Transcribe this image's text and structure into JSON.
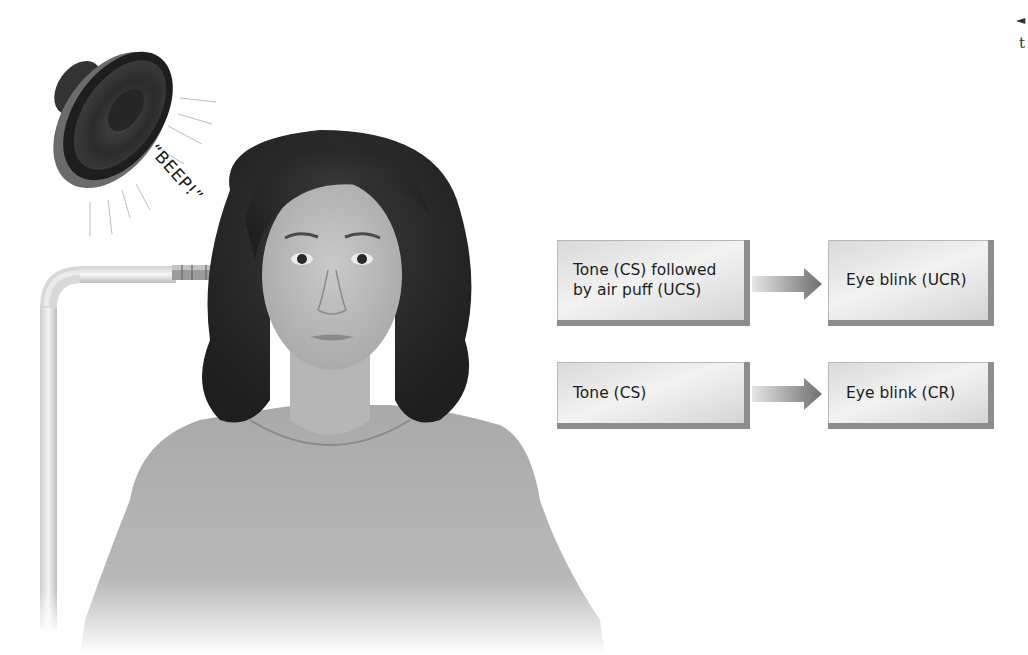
{
  "figure": {
    "sound_effect_label": "“BEEP!”",
    "stimulus_source": "speaker",
    "apparatus": "air-puff tube"
  },
  "diagram": {
    "rows": [
      {
        "stimulus": "Tone (CS) followed\nby air puff (UCS)",
        "response": "Eye blink (UCR)"
      },
      {
        "stimulus": "Tone (CS)",
        "response": "Eye blink (CR)"
      }
    ],
    "arrow_icon": "right-arrow-icon"
  },
  "edge_fragment": {
    "nav_icon": "left-triangle-icon",
    "glyph": "◄",
    "letter": "t"
  },
  "colors": {
    "box_light": "#f2f2f2",
    "box_dark": "#cfcfcf",
    "box_shadow": "#8d8d8d",
    "arrow_start": "#e6e6e6",
    "arrow_end": "#6e6e6e",
    "text": "#1c1c1c"
  }
}
